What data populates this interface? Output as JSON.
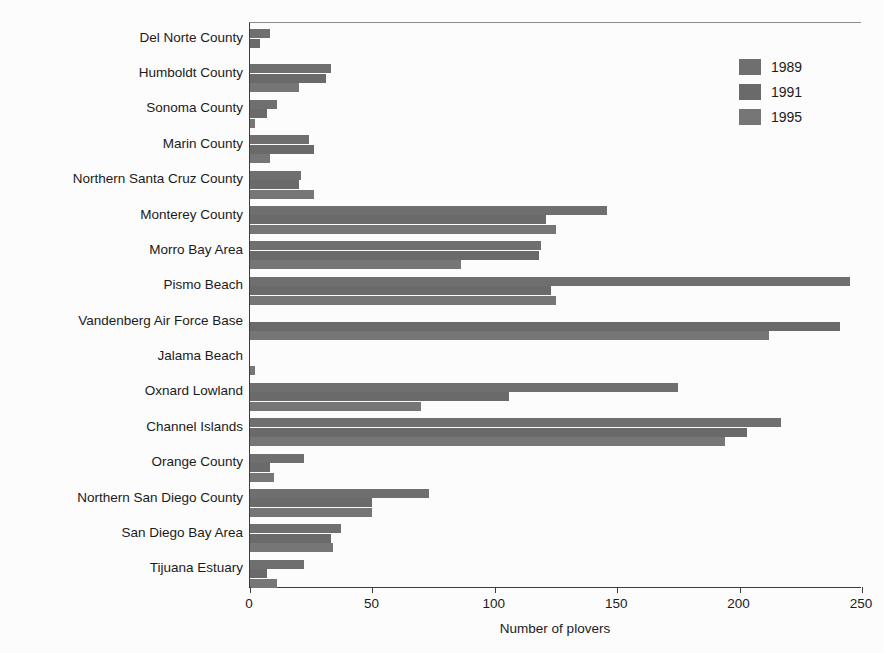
{
  "chart_data": {
    "type": "bar",
    "orientation": "horizontal",
    "title": "",
    "xlabel": "Number of plovers",
    "ylabel": "",
    "xlim": [
      0,
      250
    ],
    "xticks": [
      0,
      50,
      100,
      150,
      200,
      250
    ],
    "grid": false,
    "legend_position": "top-right",
    "categories": [
      "Del Norte County",
      "Humboldt County",
      "Sonoma County",
      "Marin County",
      "Northern Santa Cruz County",
      "Monterey County",
      "Morro Bay Area",
      "Pismo Beach",
      "Vandenberg Air Force Base",
      "Jalama Beach",
      "Oxnard Lowland",
      "Channel Islands",
      "Orange County",
      "Northern San Diego County",
      "San Diego Bay Area",
      "Tijuana Estuary"
    ],
    "series": [
      {
        "name": "1989",
        "color": "#6f6f6f",
        "values": [
          8,
          33,
          11,
          24,
          21,
          146,
          119,
          245,
          0,
          0,
          175,
          217,
          22,
          73,
          37,
          22
        ]
      },
      {
        "name": "1991",
        "color": "#6a6a6a",
        "values": [
          4,
          31,
          7,
          26,
          20,
          121,
          118,
          123,
          241,
          0,
          106,
          203,
          8,
          50,
          33,
          7
        ]
      },
      {
        "name": "1995",
        "color": "#767676",
        "values": [
          0,
          20,
          2,
          8,
          26,
          125,
          86,
          125,
          212,
          2,
          70,
          194,
          10,
          50,
          34,
          11
        ]
      }
    ]
  },
  "legend": {
    "items": [
      {
        "label": "1989"
      },
      {
        "label": "1991"
      },
      {
        "label": "1995"
      }
    ]
  },
  "axis": {
    "x_title": "Number of plovers",
    "tick_labels": [
      "0",
      "50",
      "100",
      "150",
      "200",
      "250"
    ]
  }
}
